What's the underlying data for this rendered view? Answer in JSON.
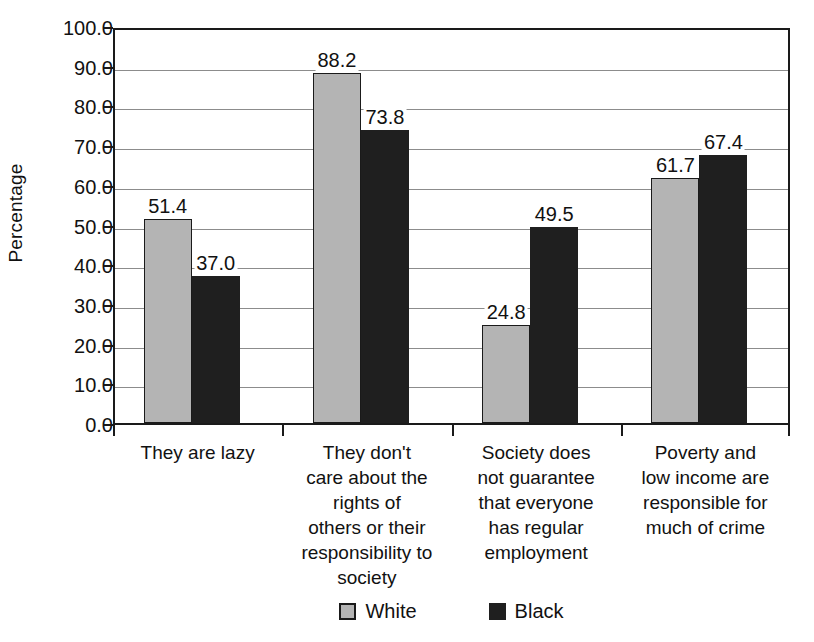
{
  "chart_data": {
    "type": "bar",
    "title": "",
    "subtitle": "",
    "xlabel": "",
    "ylabel": "Percentage",
    "ylim": [
      0,
      100
    ],
    "ytick_step": 10,
    "ytick_labels": [
      "100.0",
      "90.0",
      "80.0",
      "70.0",
      "60.0",
      "50.0",
      "40.0",
      "30.0",
      "20.0",
      "10.0",
      "0.0"
    ],
    "grid": true,
    "legend_position": "bottom",
    "categories": [
      "They are lazy",
      "They don't care about the rights of others or their responsibility to society",
      "Society does not guarantee that everyone has regular employment",
      "Poverty and low income are responsible for much of crime"
    ],
    "category_lines": [
      [
        "They are lazy"
      ],
      [
        "They don't",
        "care about the",
        "rights of",
        "others or their",
        "responsibility to",
        "society"
      ],
      [
        "Society does",
        "not guarantee",
        "that everyone",
        "has regular",
        "employment"
      ],
      [
        "Poverty and",
        "low income are",
        "responsible for",
        "much of crime"
      ]
    ],
    "series": [
      {
        "name": "White",
        "color": "#b4b4b4",
        "values": [
          51.4,
          88.2,
          24.8,
          61.7
        ],
        "value_labels": [
          "51.4",
          "88.2",
          "24.8",
          "61.7"
        ]
      },
      {
        "name": "Black",
        "color": "#1f1f1f",
        "values": [
          37.0,
          73.8,
          49.5,
          67.4
        ],
        "value_labels": [
          "37.0",
          "73.8",
          "49.5",
          "67.4"
        ]
      }
    ]
  },
  "legend": {
    "items": [
      {
        "label": "White",
        "swatch": "white-series"
      },
      {
        "label": "Black",
        "swatch": "black-series"
      }
    ]
  },
  "axes": {
    "y_title": "Percentage"
  }
}
